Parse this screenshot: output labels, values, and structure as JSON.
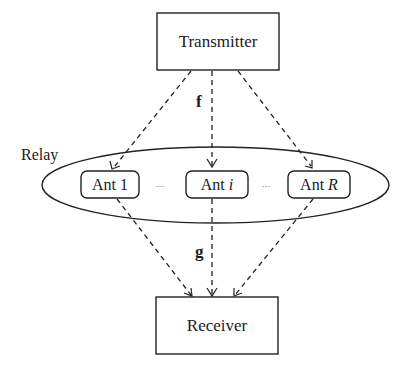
{
  "diagram": {
    "nodes": {
      "transmitter": {
        "label": "Transmitter"
      },
      "receiver": {
        "label": "Receiver"
      },
      "relay": {
        "label": "Relay"
      },
      "antennas": [
        {
          "prefix": "Ant",
          "index": "1"
        },
        {
          "prefix": "Ant",
          "index": "i"
        },
        {
          "prefix": "Ant",
          "index": "R"
        }
      ],
      "ellipsis_left": "···",
      "ellipsis_right": "···"
    },
    "edge_labels": {
      "first_hop": "f",
      "second_hop": "g"
    },
    "edges": [
      {
        "from": "Transmitter",
        "to": "Ant 1",
        "style": "dashed"
      },
      {
        "from": "Transmitter",
        "to": "Ant i",
        "style": "dashed"
      },
      {
        "from": "Transmitter",
        "to": "Ant R",
        "style": "dashed"
      },
      {
        "from": "Ant 1",
        "to": "Receiver",
        "style": "dashed"
      },
      {
        "from": "Ant i",
        "to": "Receiver",
        "style": "dashed"
      },
      {
        "from": "Ant R",
        "to": "Receiver",
        "style": "dashed"
      }
    ]
  }
}
